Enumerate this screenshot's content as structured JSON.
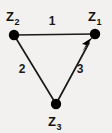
{
  "diagram": {
    "type": "directed-graph-triangle",
    "background_color": "#f2f1ef",
    "stroke_color": "#1a1a1a",
    "node_color": "#000000",
    "nodes": [
      {
        "id": "z1",
        "base": "Z",
        "subscript": "1",
        "label": "Z1",
        "position": "top-right",
        "x": 95,
        "y": 34,
        "label_x": 88,
        "label_y": 20
      },
      {
        "id": "z2",
        "base": "Z",
        "subscript": "2",
        "label": "Z2",
        "position": "top-left",
        "x": 14,
        "y": 35,
        "label_x": 6,
        "label_y": 21
      },
      {
        "id": "z3",
        "base": "Z",
        "subscript": "3",
        "label": "Z3",
        "position": "bottom-center",
        "x": 56,
        "y": 104,
        "label_x": 48,
        "label_y": 126
      }
    ],
    "edges": [
      {
        "id": "edge-1",
        "label": "1",
        "from": "z2",
        "to": "z1",
        "directed": false,
        "label_x": 52,
        "label_y": 25
      },
      {
        "id": "edge-2",
        "label": "2",
        "from": "z2",
        "to": "z3",
        "directed": false,
        "label_x": 22,
        "label_y": 73
      },
      {
        "id": "edge-3",
        "label": "3",
        "from": "z3",
        "to": "z1",
        "directed": true,
        "label_x": 80,
        "label_y": 73
      }
    ]
  }
}
